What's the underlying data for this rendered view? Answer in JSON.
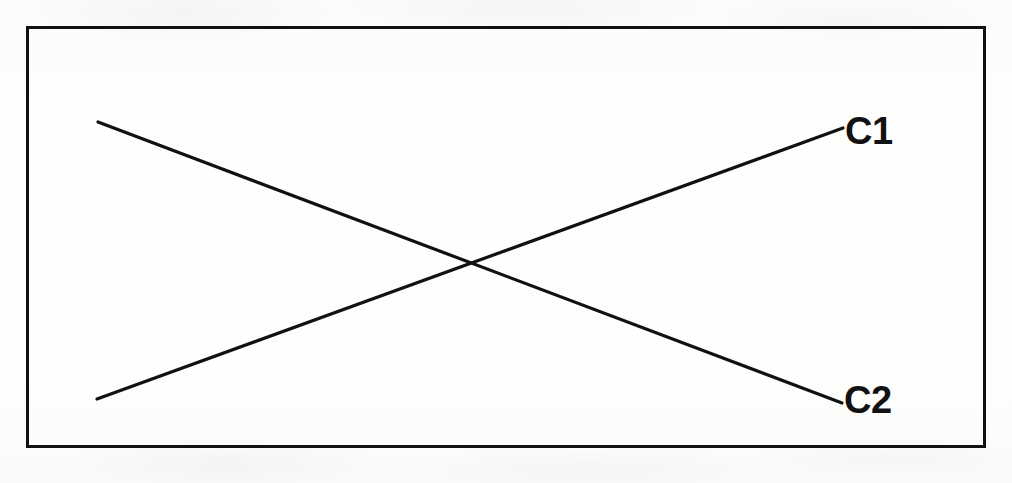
{
  "figure": {
    "background_color": "#fdfdfc",
    "ink_color": "#111111",
    "frame": {
      "name": "figure-border-rectangle",
      "x": 26,
      "y": 26,
      "width": 960,
      "height": 422,
      "stroke_width": 3
    },
    "labels": {
      "c1": "C1",
      "c2": "C2"
    }
  },
  "chart_data": {
    "type": "line",
    "title": "",
    "subtitle": "",
    "xlabel": "",
    "ylabel": "",
    "grid": false,
    "legend": "inline-right-end-labels",
    "axis_ticks": [],
    "xlim": [
      0,
      1
    ],
    "ylim": [
      0,
      1
    ],
    "annotations": [
      "C1",
      "C2"
    ],
    "intersection_point": {
      "x_px": 463,
      "y_px": 264
    },
    "series": [
      {
        "name": "C1",
        "label": "C1",
        "direction": "increasing",
        "color": "#111111",
        "stroke_width": 3,
        "x": [
          0,
          1
        ],
        "values": [
          0,
          1
        ],
        "pixel_points": [
          [
            97,
            399
          ],
          [
            843,
            128
          ]
        ],
        "label_position_px": [
          845,
          112
        ]
      },
      {
        "name": "C2",
        "label": "C2",
        "direction": "decreasing",
        "color": "#111111",
        "stroke_width": 3,
        "x": [
          0,
          1
        ],
        "values": [
          1,
          0
        ],
        "pixel_points": [
          [
            98,
            122
          ],
          [
            842,
            403
          ]
        ],
        "label_position_px": [
          844,
          381
        ]
      }
    ]
  }
}
